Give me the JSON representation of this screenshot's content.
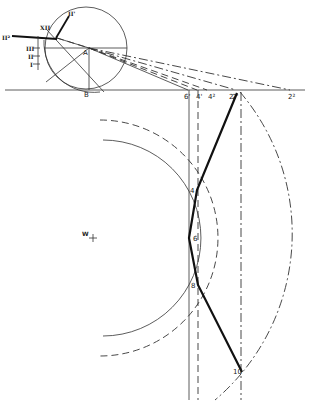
{
  "diagram": {
    "type": "geometric-construction",
    "small_circle": {
      "labels": {
        "A": "A",
        "B": "B",
        "roman_I": "I",
        "roman_II": "II",
        "roman_III": "III",
        "roman_XII": "XII",
        "II_prime": "II'",
        "II_double": "II²"
      }
    },
    "baseline_labels": {
      "p6": "6'",
      "p4a": "4'",
      "p4b": "4²",
      "p2a": "2'",
      "p2b": "2²"
    },
    "points": {
      "p2": "2",
      "p4": "4",
      "p6": "6",
      "p8": "8",
      "p10": "10"
    },
    "center_label": "W",
    "colors": {
      "ink": "#222222",
      "background": "#ffffff"
    }
  }
}
